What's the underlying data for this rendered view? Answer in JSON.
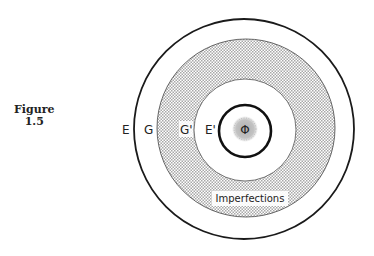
{
  "caption": {
    "line1": "Figure",
    "line2": "1.5"
  },
  "diagram": {
    "labels": {
      "outer_boundary": "E",
      "outer_ring": "G",
      "inner_ring": "G'",
      "inner_boundary": "E'",
      "core": "Φ",
      "shaded_region": "Imperfections"
    },
    "colors": {
      "line": "#1a1a1a",
      "hatch": "#9a9a9a",
      "background": "#ffffff"
    }
  }
}
